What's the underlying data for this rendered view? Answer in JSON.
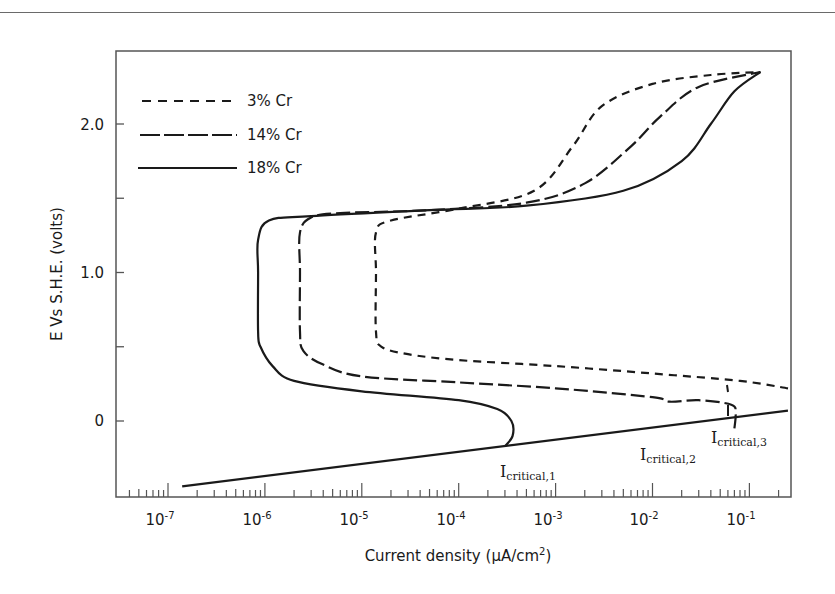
{
  "chart_data": {
    "type": "line",
    "title": "",
    "xlabel": "Current density (μA/cm²)",
    "ylabel": "E Vs S.H.E. (volts)",
    "xscale": "log",
    "xlim": [
      5e-08,
      0.3
    ],
    "ylim": [
      -0.5,
      2.5
    ],
    "grid": false,
    "legend_position": "upper left",
    "x_ticks": [
      {
        "value": 1e-07,
        "mantissa": "10",
        "exp": "-7"
      },
      {
        "value": 1e-06,
        "mantissa": "10",
        "exp": "-6"
      },
      {
        "value": 1e-05,
        "mantissa": "10",
        "exp": "-5"
      },
      {
        "value": 0.0001,
        "mantissa": "10",
        "exp": "-4"
      },
      {
        "value": 0.001,
        "mantissa": "10",
        "exp": "-3"
      },
      {
        "value": 0.01,
        "mantissa": "10",
        "exp": "-2"
      },
      {
        "value": 0.1,
        "mantissa": "10",
        "exp": "-1"
      }
    ],
    "y_ticks": [
      {
        "value": 0,
        "label": "0"
      },
      {
        "value": 0.5,
        "label": ""
      },
      {
        "value": 1.0,
        "label": "1.0"
      },
      {
        "value": 1.5,
        "label": ""
      },
      {
        "value": 2.0,
        "label": "2.0"
      }
    ],
    "series": [
      {
        "name": "3% Cr",
        "style": "short-dash",
        "points": [
          [
            0.25,
            0.22
          ],
          [
            0.08,
            0.27
          ],
          [
            0.01,
            0.32
          ],
          [
            0.001,
            0.37
          ],
          [
            0.0001,
            0.41
          ],
          [
            3e-05,
            0.45
          ],
          [
            1.6e-05,
            0.5
          ],
          [
            1.4e-05,
            0.6
          ],
          [
            1.4e-05,
            1.0
          ],
          [
            1.4e-05,
            1.27
          ],
          [
            2e-05,
            1.35
          ],
          [
            0.0001,
            1.43
          ],
          [
            0.0006,
            1.55
          ],
          [
            0.0015,
            1.85
          ],
          [
            0.003,
            2.12
          ],
          [
            0.01,
            2.27
          ],
          [
            0.04,
            2.33
          ],
          [
            0.13,
            2.35
          ]
        ]
      },
      {
        "name": "14% Cr",
        "style": "long-dash",
        "points": [
          [
            0.07,
            -0.05
          ],
          [
            0.072,
            0.05
          ],
          [
            0.065,
            0.11
          ],
          [
            0.03,
            0.14
          ],
          [
            0.015,
            0.13
          ],
          [
            0.01,
            0.16
          ],
          [
            0.001,
            0.22
          ],
          [
            0.0001,
            0.26
          ],
          [
            1e-05,
            0.3
          ],
          [
            4e-06,
            0.38
          ],
          [
            2.5e-06,
            0.47
          ],
          [
            2.3e-06,
            0.6
          ],
          [
            2.3e-06,
            1.0
          ],
          [
            2.3e-06,
            1.27
          ],
          [
            3e-06,
            1.37
          ],
          [
            6e-06,
            1.4
          ],
          [
            5e-05,
            1.42
          ],
          [
            0.0005,
            1.47
          ],
          [
            0.002,
            1.6
          ],
          [
            0.006,
            1.85
          ],
          [
            0.012,
            2.05
          ],
          [
            0.03,
            2.25
          ],
          [
            0.13,
            2.35
          ]
        ]
      },
      {
        "name": "18% Cr",
        "style": "solid",
        "points": [
          [
            0.0003,
            -0.17
          ],
          [
            0.00036,
            -0.1
          ],
          [
            0.00035,
            0.0
          ],
          [
            0.00025,
            0.08
          ],
          [
            0.0001,
            0.14
          ],
          [
            1e-05,
            0.2
          ],
          [
            2e-06,
            0.27
          ],
          [
            1.2e-06,
            0.37
          ],
          [
            9e-07,
            0.5
          ],
          [
            8.5e-07,
            0.6
          ],
          [
            8.5e-07,
            1.0
          ],
          [
            8.5e-07,
            1.22
          ],
          [
            1.1e-06,
            1.35
          ],
          [
            3e-06,
            1.38
          ],
          [
            5e-05,
            1.42
          ],
          [
            0.0005,
            1.45
          ],
          [
            0.005,
            1.55
          ],
          [
            0.02,
            1.75
          ],
          [
            0.04,
            2.0
          ],
          [
            0.07,
            2.22
          ],
          [
            0.13,
            2.35
          ]
        ]
      },
      {
        "name": "Cathodic line",
        "style": "solid",
        "show_in_legend": false,
        "points": [
          [
            1.4e-07,
            -0.44
          ],
          [
            0.25,
            0.07
          ]
        ]
      }
    ],
    "annotations": [
      {
        "text": "I",
        "sub": "critical,1",
        "x": 0.00032,
        "y": -0.17
      },
      {
        "text": "I",
        "sub": "critical,2",
        "x": 0.018,
        "y": -0.03
      },
      {
        "text": "I",
        "sub": "critical,3",
        "x": 0.07,
        "y": 0.02
      }
    ]
  },
  "legend": {
    "items": [
      {
        "label": "3% Cr"
      },
      {
        "label": "14% Cr"
      },
      {
        "label": "18% Cr"
      }
    ]
  },
  "labels": {
    "ylabel": "E Vs S.H.E. (volts)",
    "xlabel_main": "Current density (",
    "xlabel_mu": "μ",
    "xlabel_unit": "A/cm",
    "xlabel_sup": "2",
    "xlabel_close": ")",
    "y0": "0",
    "y1": "1.0",
    "y2": "2.0",
    "x_mantissa": "10",
    "xe7": "-7",
    "xe6": "-6",
    "xe5": "-5",
    "xe4": "-4",
    "xe3": "-3",
    "xe2": "-2",
    "xe1": "-1",
    "anno_I": "I",
    "anno1_sub": "critical,1",
    "anno2_sub": "critical,2",
    "anno3_sub": "critical,3"
  }
}
